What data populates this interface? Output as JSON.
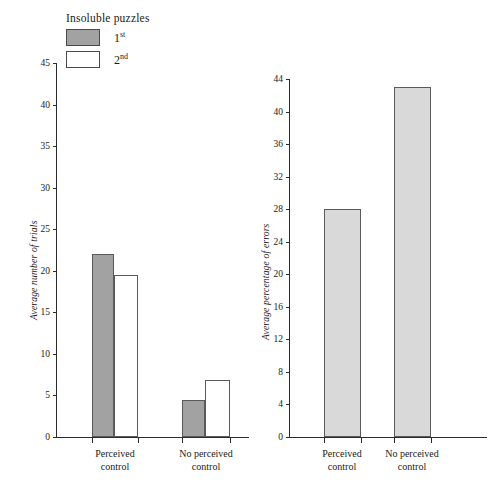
{
  "legend": {
    "title": "Insoluble puzzles",
    "items": [
      {
        "label": "1",
        "sup": "st",
        "swatch": "#a2a2a2"
      },
      {
        "label": "2",
        "sup": "nd",
        "swatch": "#ffffff"
      }
    ]
  },
  "chart_data": [
    {
      "type": "bar",
      "title": "",
      "xlabel": "",
      "ylabel": "Average number of trials",
      "ylim": [
        0,
        45
      ],
      "yticks": [
        0,
        5,
        10,
        15,
        20,
        25,
        30,
        35,
        40,
        45
      ],
      "ytick_labels": [
        "0",
        "5",
        "10",
        "15",
        "20",
        "25",
        "30",
        "35",
        "40",
        "45"
      ],
      "categories": [
        "Perceived control",
        "No perceived control"
      ],
      "grid": false,
      "legend_position": "top-left",
      "series": [
        {
          "name": "1st",
          "color": "#a2a2a2",
          "values": [
            22,
            4.5
          ]
        },
        {
          "name": "2nd",
          "color": "#ffffff",
          "values": [
            19.5,
            6.8
          ]
        }
      ]
    },
    {
      "type": "bar",
      "title": "",
      "xlabel": "",
      "ylabel": "Average percentage of errors",
      "ylim": [
        0,
        44
      ],
      "yticks": [
        0,
        4,
        8,
        12,
        16,
        20,
        24,
        28,
        32,
        36,
        40,
        44
      ],
      "ytick_labels": [
        "0",
        "4",
        "8",
        "12",
        "16",
        "20",
        "24",
        "28",
        "32",
        "36",
        "40",
        "44"
      ],
      "categories": [
        "Perceived control",
        "No perceived control"
      ],
      "grid": false,
      "legend_position": "none",
      "series": [
        {
          "name": "errors",
          "color": "#d9d9d9",
          "values": [
            28,
            43
          ]
        }
      ]
    }
  ],
  "left_chart": {
    "y_axis_title": "Average number of trials",
    "y_tick_labels": [
      "45",
      "40",
      "35",
      "30",
      "25",
      "20",
      "15",
      "10",
      "5",
      "0"
    ],
    "category_labels": [
      {
        "line1": "Perceived",
        "line2": "control"
      },
      {
        "line1": "No perceived",
        "line2": "control"
      }
    ]
  },
  "right_chart": {
    "y_axis_title": "Average percentage of errors",
    "y_tick_labels": [
      "44",
      "40",
      "36",
      "32",
      "28",
      "24",
      "20",
      "16",
      "12",
      "8",
      "4",
      "0"
    ],
    "category_labels": [
      {
        "line1": "Perceived",
        "line2": "control"
      },
      {
        "line1": "No perceived",
        "line2": "control"
      }
    ]
  }
}
